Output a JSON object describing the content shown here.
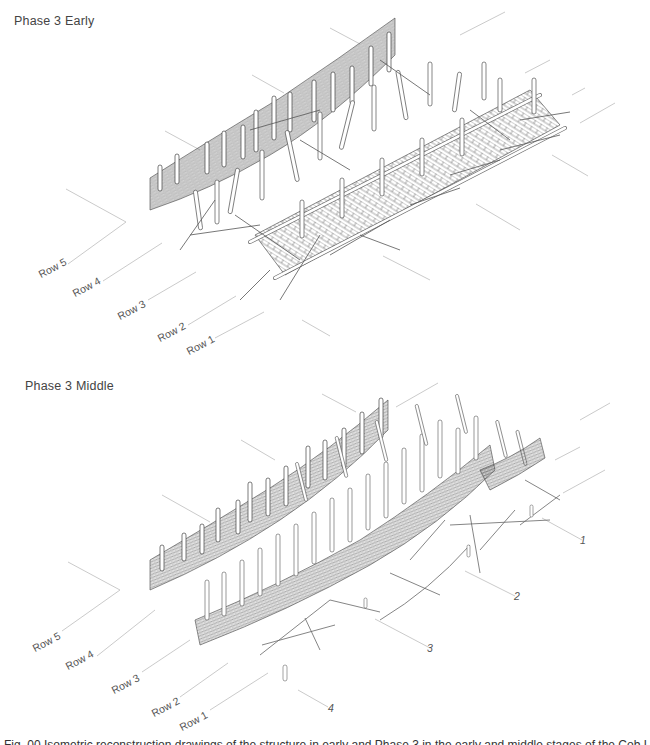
{
  "figure": {
    "panels": [
      {
        "title": "Phase 3 Early",
        "row_labels": [
          "Row 5",
          "Row 4",
          "Row 3",
          "Row 2",
          "Row 1"
        ]
      },
      {
        "title": "Phase 3 Middle",
        "row_labels": [
          "Row 5",
          "Row 4",
          "Row 3",
          "Row 2",
          "Row 1"
        ],
        "callouts": [
          "1",
          "2",
          "3",
          "4"
        ]
      }
    ],
    "caption_partial": "Fig. 00 Isometric reconstruction drawings of the structure in early and Phase 3 in the early and middle stages of the Cob L"
  },
  "colors": {
    "ink": "#444444",
    "guide": "#bbbbbb",
    "text": "#555555",
    "background": "#ffffff"
  }
}
